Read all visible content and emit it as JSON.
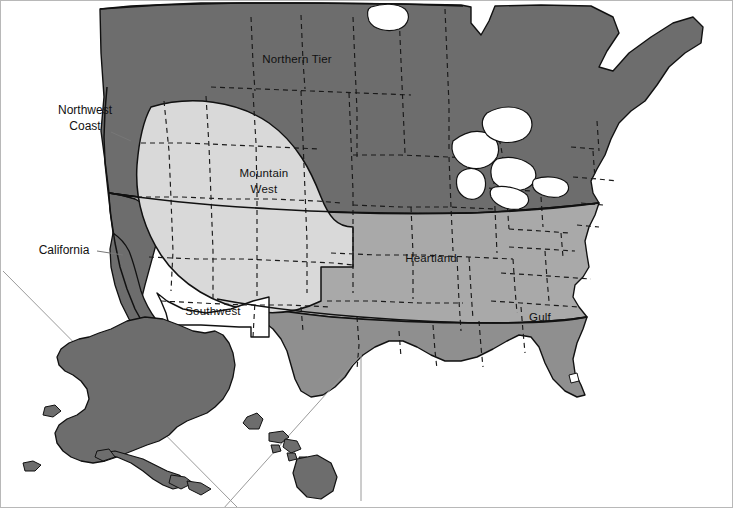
{
  "map": {
    "title": "United States Regional Divisions Map",
    "frame_border_color": "#b8b8b8",
    "background": "#ffffff",
    "regions": [
      {
        "id": "northern-tier",
        "label": "Northern Tier",
        "color": "#6d6d6d",
        "label_x": 296,
        "label_y": 58,
        "label_anchor": "middle",
        "lines": [
          "Northern Tier"
        ],
        "placement": "inside"
      },
      {
        "id": "northwest-coast",
        "label": "Northwest Coast",
        "color": "#6d6d6d",
        "label_x": 84,
        "label_y": 109,
        "label_anchor": "middle",
        "lines": [
          "Northwest",
          "Coast"
        ],
        "placement": "callout"
      },
      {
        "id": "california",
        "label": "California",
        "color": "#6d6d6d",
        "label_x": 63,
        "label_y": 249,
        "label_anchor": "middle",
        "lines": [
          "California"
        ],
        "placement": "callout"
      },
      {
        "id": "mountain-west",
        "label": "Mountain West",
        "color": "#d9d9d9",
        "label_x": 263,
        "label_y": 176,
        "label_anchor": "middle",
        "lines": [
          "Mountain",
          "West"
        ],
        "placement": "inside"
      },
      {
        "id": "southwest",
        "label": "Southwest",
        "color": "#ffffff",
        "label_x": 212,
        "label_y": 310,
        "label_anchor": "middle",
        "lines": [
          "Southwest"
        ],
        "placement": "inside"
      },
      {
        "id": "heartland",
        "label": "Heartland",
        "color": "#a9a9a9",
        "label_x": 430,
        "label_y": 257,
        "label_anchor": "middle",
        "lines": [
          "Heartland"
        ],
        "placement": "inside"
      },
      {
        "id": "gulf",
        "label": "Gulf",
        "color": "#8f8f8f",
        "label_x": 539,
        "label_y": 316,
        "label_anchor": "middle",
        "lines": [
          "Gulf"
        ],
        "placement": "inside"
      }
    ],
    "insets": [
      {
        "id": "alaska",
        "name": "Alaska",
        "fill": "#6d6d6d"
      },
      {
        "id": "hawaii",
        "name": "Hawaii",
        "fill": "#6d6d6d"
      }
    ],
    "legend_visible": false,
    "state_boundary_style": "dashed",
    "colors": {
      "dark_gray": "#6d6d6d",
      "mid_gray": "#8f8f8f",
      "light_mid_gray": "#a9a9a9",
      "pale_gray": "#d9d9d9",
      "white": "#ffffff",
      "outline": "#111111",
      "inset_divider": "#9a9a9a"
    }
  }
}
